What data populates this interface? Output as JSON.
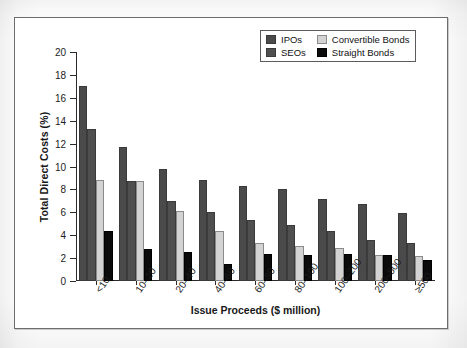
{
  "chart_data": {
    "type": "bar",
    "title": "",
    "xlabel": "Issue Proceeds ($ million)",
    "ylabel": "Total Direct Costs (%)",
    "ylim": [
      0,
      20
    ],
    "ytick_step": 2,
    "yticks": [
      0,
      2,
      4,
      6,
      8,
      10,
      12,
      14,
      16,
      18,
      20
    ],
    "ytick_labels": [
      "0",
      "2",
      "4",
      "6",
      "8",
      "10",
      "12",
      "14",
      "16",
      "18",
      "20"
    ],
    "grid": false,
    "legend_position": "top-right",
    "categories": [
      "<10",
      "10–20",
      "20–40",
      "40–60",
      "60–80",
      "80–100",
      "100–200",
      "200–500",
      "≥500"
    ],
    "series": [
      {
        "name": "IPOs",
        "color": "#4a4a4a",
        "values": [
          17.0,
          11.7,
          9.8,
          8.8,
          8.3,
          8.0,
          7.2,
          6.7,
          5.9
        ]
      },
      {
        "name": "SEOs",
        "color": "#4f4f4f",
        "values": [
          13.3,
          8.7,
          7.0,
          6.0,
          5.3,
          4.85,
          4.35,
          3.6,
          3.3
        ]
      },
      {
        "name": "Convertible Bonds",
        "color": "#d3d3d3",
        "values": [
          8.8,
          8.7,
          6.15,
          4.4,
          3.3,
          3.1,
          2.85,
          2.3,
          2.2
        ]
      },
      {
        "name": "Straight Bonds",
        "color": "#0b0b0b",
        "values": [
          4.4,
          2.8,
          2.5,
          1.45,
          2.4,
          2.25,
          2.4,
          2.3,
          1.8
        ]
      }
    ]
  },
  "legend": {
    "items": [
      {
        "label": "IPOs",
        "swatch": "ipos",
        "swatch_name": "legend-swatch-ipos"
      },
      {
        "label": "Convertible Bonds",
        "swatch": "conv",
        "swatch_name": "legend-swatch-convertible-bonds"
      },
      {
        "label": "SEOs",
        "swatch": "seos",
        "swatch_name": "legend-swatch-seos"
      },
      {
        "label": "Straight Bonds",
        "swatch": "straight",
        "swatch_name": "legend-swatch-straight-bonds"
      }
    ]
  },
  "colors": {
    "ipos": "#4a4a4a",
    "seos": "#4f4f4f",
    "convertible_bonds": "#d3d3d3",
    "straight_bonds": "#0b0b0b",
    "axis": "#2a2a2a",
    "frame": "#6d6d6d",
    "background": "#ffffff"
  }
}
